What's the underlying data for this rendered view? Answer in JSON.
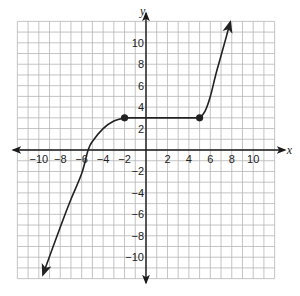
{
  "chart_data": {
    "type": "line",
    "title": "",
    "xlabel": "x",
    "ylabel": "y",
    "xlim": [
      -12,
      12
    ],
    "ylim": [
      -12,
      12
    ],
    "grid": true,
    "grid_step": 1,
    "x_ticks": [
      -10,
      -8,
      -6,
      -4,
      -2,
      2,
      4,
      6,
      8,
      10
    ],
    "y_ticks": [
      -10,
      -8,
      -6,
      -4,
      -2,
      2,
      4,
      6,
      8,
      10
    ],
    "x_tick_labels": [
      "−10",
      "−8",
      "−6",
      "−4",
      "−2",
      "2",
      "4",
      "6",
      "8",
      "10"
    ],
    "y_tick_labels": [
      "−10",
      "−8",
      "−6",
      "−4",
      "−2",
      "2",
      "4",
      "6",
      "8",
      "10"
    ],
    "series": [
      {
        "name": "left-piece",
        "description": "increasing curve from arrow at bottom-left, leveling off at (-2, 3)",
        "points": [
          [
            -9.6,
            -11.6
          ],
          [
            -8,
            -7.2
          ],
          [
            -7,
            -4.6
          ],
          [
            -6,
            -2.2
          ],
          [
            -5.4,
            0
          ],
          [
            -5,
            0.8
          ],
          [
            -4,
            2.0
          ],
          [
            -3,
            2.7
          ],
          [
            -2,
            3
          ]
        ],
        "start_arrow": true
      },
      {
        "name": "middle-piece",
        "description": "horizontal segment y = 3",
        "points": [
          [
            -2,
            3
          ],
          [
            5,
            3
          ]
        ]
      },
      {
        "name": "right-piece",
        "description": "increasing curve from (5, 3) to arrow at top-right",
        "points": [
          [
            5,
            3
          ],
          [
            5.5,
            3.6
          ],
          [
            6,
            5
          ],
          [
            6.5,
            7
          ],
          [
            7,
            8.8
          ],
          [
            7.5,
            10.6
          ],
          [
            7.85,
            11.9
          ]
        ],
        "end_arrow": true
      }
    ],
    "key_points": [
      {
        "x": -2,
        "y": 3,
        "marker": "filled-circle"
      },
      {
        "x": 5,
        "y": 3,
        "marker": "filled-circle"
      }
    ]
  },
  "colors": {
    "grid": "#b5b5b5",
    "axis": "#1a1a1a",
    "curve": "#222222"
  }
}
